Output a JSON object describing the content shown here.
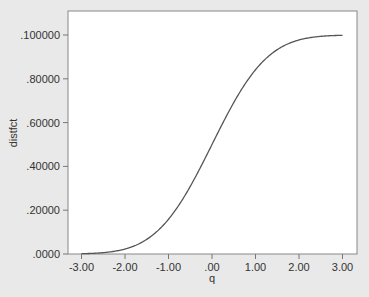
{
  "chart_data": {
    "type": "line",
    "title": "",
    "xlabel": "q",
    "ylabel": "distfct",
    "xlim": [
      -3.3,
      3.3
    ],
    "ylim": [
      0,
      1.1
    ],
    "x_ticks": [
      -3,
      -2,
      -1,
      0,
      1,
      2,
      3
    ],
    "x_tick_labels": [
      "-3.00",
      "-2.00",
      "-1.00",
      ".00",
      "1.00",
      "2.00",
      "3.00"
    ],
    "y_ticks": [
      0,
      0.2,
      0.4,
      0.6,
      0.8,
      1.0
    ],
    "y_tick_labels": [
      ".0000",
      ".20000",
      ".40000",
      ".60000",
      ".80000",
      ".100000"
    ],
    "grid": false,
    "legend": null,
    "series": [
      {
        "name": "distfct",
        "x": [
          -3.0,
          -2.5,
          -2.0,
          -1.5,
          -1.0,
          -0.5,
          0.0,
          0.5,
          1.0,
          1.5,
          2.0,
          2.5,
          3.0
        ],
        "y": [
          0.0013,
          0.0062,
          0.0228,
          0.0668,
          0.1587,
          0.3085,
          0.5,
          0.6915,
          0.8413,
          0.9332,
          0.9772,
          0.9938,
          0.9987
        ]
      }
    ],
    "colors": {
      "line": "#555555",
      "plot_bg": "#ffffff",
      "page_bg": "#e9e9e9",
      "axis": "#777777"
    }
  }
}
